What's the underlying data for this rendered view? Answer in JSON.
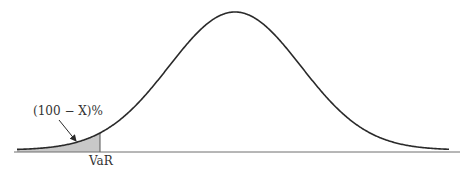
{
  "diagram": {
    "title": "",
    "type": "normal-distribution-var",
    "labels": {
      "tail_probability": "(100 − X)%",
      "var_marker": "VaR"
    },
    "colors": {
      "curve": "#2a2a2a",
      "axis": "#6e6e6e",
      "tail_fill": "#c8c8c8",
      "text": "#333333"
    },
    "geometry": {
      "baseline_y": 152,
      "baseline_x_start": 14,
      "baseline_x_end": 460,
      "peak_x": 235,
      "peak_y": 12,
      "var_x": 100
    }
  }
}
